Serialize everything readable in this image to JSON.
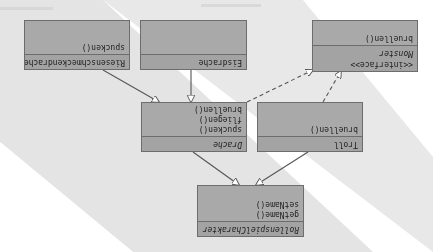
{
  "diagram": {
    "type": "uml-class-diagram",
    "orientation": "rotated-180",
    "classes": [
      {
        "id": "rollenspielcharakter",
        "name": "RollenspielCharakter",
        "italic": true,
        "methods": [
          "getName()",
          "setName()"
        ]
      },
      {
        "id": "drache",
        "name": "Drache",
        "italic": true,
        "methods": [
          "spucken()",
          "fliegen()",
          "bruellen()"
        ]
      },
      {
        "id": "troll",
        "name": "Troll",
        "italic": false,
        "methods": [
          "bruellen()"
        ]
      },
      {
        "id": "monster",
        "name": "Monster",
        "stereotype": "<<interface>>",
        "italic": true,
        "methods": [
          "bruellen()"
        ]
      },
      {
        "id": "riesenschmeckendrache",
        "name": "Riesenschmeckendrache",
        "italic": false,
        "methods": [
          "spucken()"
        ]
      },
      {
        "id": "eisdrache",
        "name": "Eisdrache",
        "italic": false,
        "methods": []
      }
    ],
    "relations": [
      {
        "from": "Drache",
        "to": "RollenspielCharakter",
        "type": "generalization"
      },
      {
        "from": "Troll",
        "to": "RollenspielCharakter",
        "type": "generalization"
      },
      {
        "from": "Riesenschmeckendrache",
        "to": "Drache",
        "type": "generalization"
      },
      {
        "from": "Eisdrache",
        "to": "Drache",
        "type": "generalization"
      },
      {
        "from": "Drache",
        "to": "Monster",
        "type": "realization"
      },
      {
        "from": "Troll",
        "to": "Monster",
        "type": "realization"
      }
    ],
    "colors": {
      "box_fill": "#a9a9a9",
      "box_border": "#6d6d6d",
      "line": "#555555",
      "background_band": "#e6e6e6"
    }
  }
}
